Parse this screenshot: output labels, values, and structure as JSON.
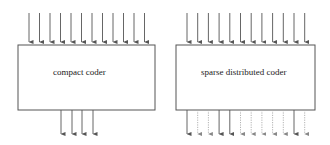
{
  "diagram": {
    "colors": {
      "stroke": "#555555",
      "solid_arrow": "#555555",
      "dotted_arrow": "#aaaaaa",
      "background": "#ffffff",
      "text": "#222222"
    },
    "boxes": [
      {
        "id": "compact",
        "label": "compact coder",
        "x": 18,
        "y": 45,
        "width": 137,
        "height": 65,
        "label_x": 53,
        "label_y": 75,
        "inputs": {
          "count": 12,
          "x_start": 29,
          "x_step": 10.5,
          "y_from": 13,
          "y_to": 45
        },
        "outputs": {
          "x_positions": [
            61,
            72,
            82,
            93
          ],
          "styles": [
            "solid",
            "solid",
            "solid",
            "solid"
          ],
          "y_from": 110,
          "y_to": 138
        }
      },
      {
        "id": "sparse",
        "label": "sparse distributed coder",
        "x": 176,
        "y": 45,
        "width": 139,
        "height": 65,
        "label_x": 201,
        "label_y": 75,
        "inputs": {
          "count": 12,
          "x_start": 187,
          "x_step": 10.7,
          "y_from": 13,
          "y_to": 45
        },
        "outputs": {
          "x_positions": [
            187,
            197.7,
            208.4,
            219.1,
            229.8,
            240.5,
            251.2,
            261.9,
            272.6,
            283.3,
            294,
            304.7
          ],
          "styles": [
            "solid",
            "dotted",
            "dotted",
            "solid",
            "solid",
            "dotted",
            "dotted",
            "dotted",
            "dotted",
            "dotted",
            "solid",
            "dotted"
          ],
          "y_from": 110,
          "y_to": 138
        }
      }
    ]
  }
}
